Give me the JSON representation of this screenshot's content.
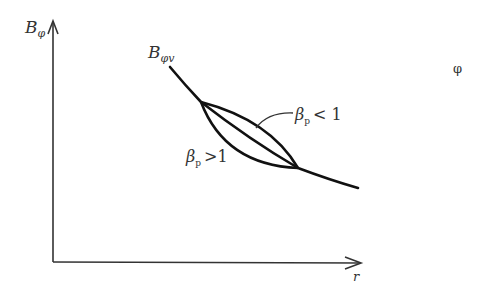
{
  "diagram": {
    "type": "line-sketch",
    "axes": {
      "y_label": "B",
      "y_label_sub": "φ",
      "x_label": "r"
    },
    "curve_label": {
      "main": "B",
      "sub": "φv"
    },
    "annotations": [
      {
        "symbol": "β",
        "sub": "p",
        "relation": "< 1"
      },
      {
        "symbol": "β",
        "sub": "p",
        "relation": ">1"
      }
    ],
    "stray_symbol": "φ",
    "colors": {
      "line": "#111111",
      "text": "#333333",
      "background": "#ffffff"
    }
  }
}
